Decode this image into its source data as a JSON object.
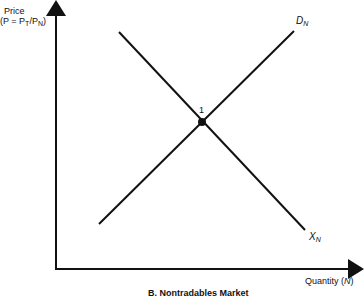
{
  "diagram": {
    "y_axis_label": "Price",
    "y_axis_formula": "(P = P",
    "y_axis_formula_sub1": "T",
    "y_axis_formula_mid": "/P",
    "y_axis_formula_sub2": "N",
    "y_axis_formula_end": ")",
    "x_axis_label": "Quantity (",
    "x_axis_var": "N",
    "x_axis_label_end": ")",
    "curve_demand_label": "D",
    "curve_demand_sub": "N",
    "curve_supply_label": "X",
    "curve_supply_sub": "N",
    "equilibrium_label": "1",
    "caption": "B. Nontradables Market"
  }
}
